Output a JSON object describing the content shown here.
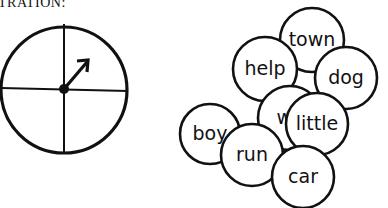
{
  "heading": "TRATION:",
  "spinner": {
    "label": "spinner",
    "cx": 64,
    "cy": 90,
    "r": 63
  },
  "words": [
    {
      "text": "town",
      "cx": 312,
      "cy": 40,
      "r": 32
    },
    {
      "text": "dog",
      "cx": 346,
      "cy": 78,
      "r": 31
    },
    {
      "text": "help",
      "cx": 265,
      "cy": 69,
      "r": 32
    },
    {
      "text": "wa",
      "cx": 290,
      "cy": 118,
      "r": 32
    },
    {
      "text": "little",
      "cx": 317,
      "cy": 124,
      "r": 31
    },
    {
      "text": "boy",
      "cx": 210,
      "cy": 134,
      "r": 30
    },
    {
      "text": "run",
      "cx": 252,
      "cy": 155,
      "r": 31
    },
    {
      "text": "car",
      "cx": 303,
      "cy": 177,
      "r": 31
    }
  ]
}
